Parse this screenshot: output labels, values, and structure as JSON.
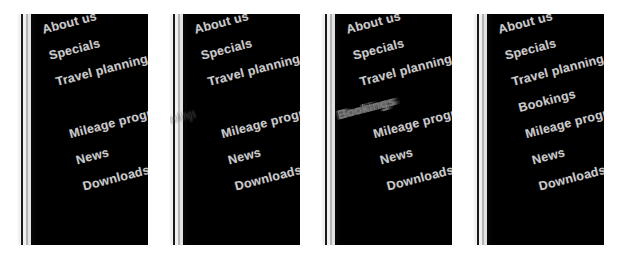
{
  "meta": {
    "background_color": "#ffffff",
    "panel_background_color": "#000000",
    "text_color": "#c9c9c9",
    "text_rotation_deg": -14.5,
    "frame_count": 4
  },
  "menu": {
    "items": [
      "About us",
      "Specials",
      "Travel planning",
      "Bookings",
      "Mileage programs",
      "News",
      "Downloads"
    ]
  },
  "frames": [
    {
      "name": "frame-1",
      "bookings_state": "hidden",
      "items": [
        {
          "label": "About us",
          "state": "settled"
        },
        {
          "label": "Specials",
          "state": "settled"
        },
        {
          "label": "Travel planning",
          "state": "settled"
        },
        {
          "label": "Bookings",
          "state": "hidden"
        },
        {
          "label": "Mileage programs",
          "state": "settled"
        },
        {
          "label": "News",
          "state": "settled"
        },
        {
          "label": "Downloads",
          "state": "settled"
        }
      ]
    },
    {
      "name": "frame-2",
      "bookings_state": "ghost-faint",
      "items": [
        {
          "label": "About us",
          "state": "settled"
        },
        {
          "label": "Specials",
          "state": "settled"
        },
        {
          "label": "Travel planning",
          "state": "settled"
        },
        {
          "label": "Bookings",
          "state": "ghost-faint"
        },
        {
          "label": "Mileage programs",
          "state": "settled"
        },
        {
          "label": "News",
          "state": "settled"
        },
        {
          "label": "Downloads",
          "state": "settled"
        }
      ]
    },
    {
      "name": "frame-3",
      "bookings_state": "ghost-blur",
      "items": [
        {
          "label": "About us",
          "state": "settled"
        },
        {
          "label": "Specials",
          "state": "settled"
        },
        {
          "label": "Travel planning",
          "state": "settled"
        },
        {
          "label": "Bookings",
          "state": "ghost-blur"
        },
        {
          "label": "Mileage programs",
          "state": "settled"
        },
        {
          "label": "News",
          "state": "settled"
        },
        {
          "label": "Downloads",
          "state": "settled"
        }
      ]
    },
    {
      "name": "frame-4",
      "bookings_state": "settled",
      "items": [
        {
          "label": "About us",
          "state": "settled"
        },
        {
          "label": "Specials",
          "state": "settled"
        },
        {
          "label": "Travel planning",
          "state": "settled"
        },
        {
          "label": "Bookings",
          "state": "settled"
        },
        {
          "label": "Mileage programs",
          "state": "settled"
        },
        {
          "label": "News",
          "state": "settled"
        },
        {
          "label": "Downloads",
          "state": "settled"
        }
      ]
    }
  ],
  "layout": {
    "frame_geometry": [
      {
        "left": 18,
        "width": 130
      },
      {
        "left": 170,
        "width": 130
      },
      {
        "left": 322,
        "width": 130
      },
      {
        "left": 474,
        "width": 130
      }
    ],
    "edge_stripes": [
      "s-white",
      "s-dark",
      "s-white",
      "s-mid",
      "s-light",
      "s-black"
    ]
  }
}
